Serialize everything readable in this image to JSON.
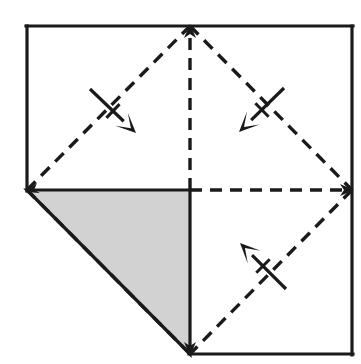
{
  "figure": {
    "canvas": {
      "width": 361,
      "height": 364,
      "background": "#ffffff"
    },
    "colors": {
      "stroke": "#1a1a1a",
      "shaded_fill": "#d2d2d2",
      "shaded_fill_label": "light gray",
      "background": "#ffffff"
    },
    "square": {
      "name": "outer square",
      "left": 27,
      "top": 26,
      "right": 352,
      "bottom": 354,
      "stroke_width": 3.2,
      "solid_edges": [
        {
          "name": "top-edge",
          "x1": 27,
          "y1": 26,
          "x2": 352,
          "y2": 26
        },
        {
          "name": "right-edge",
          "x1": 352,
          "y1": 26,
          "x2": 352,
          "y2": 354
        },
        {
          "name": "bottom-edge-right-half",
          "x1": 190,
          "y1": 354,
          "x2": 352,
          "y2": 354
        },
        {
          "name": "left-edge-upper-half",
          "x1": 27,
          "y1": 26,
          "x2": 27,
          "y2": 190
        }
      ]
    },
    "midpoints": {
      "top": {
        "x": 190,
        "y": 26
      },
      "right": {
        "x": 352,
        "y": 190
      },
      "bottom": {
        "x": 190,
        "y": 354
      },
      "left": {
        "x": 27,
        "y": 190
      },
      "center": {
        "x": 190,
        "y": 190
      }
    },
    "shaded_triangle": {
      "name": "shaded flap triangle",
      "fill": "#d2d2d2",
      "stroke": "#1a1a1a",
      "stroke_width": 3.2,
      "vertices": [
        {
          "x": 27,
          "y": 190
        },
        {
          "x": 190,
          "y": 190
        },
        {
          "x": 190,
          "y": 354
        }
      ]
    },
    "dashed_lines": {
      "dash_pattern": "12 8",
      "stroke_width": 3.4,
      "segments": [
        {
          "name": "diamond-top-left",
          "x1": 27,
          "y1": 190,
          "x2": 190,
          "y2": 26
        },
        {
          "name": "diamond-top-right",
          "x1": 190,
          "y1": 26,
          "x2": 352,
          "y2": 190
        },
        {
          "name": "diamond-bottom-right",
          "x1": 352,
          "y1": 190,
          "x2": 190,
          "y2": 354
        },
        {
          "name": "diamond-bottom-left",
          "x1": 190,
          "y1": 354,
          "x2": 27,
          "y2": 190
        },
        {
          "name": "vertical-median",
          "x1": 190,
          "y1": 190,
          "x2": 190,
          "y2": 26
        },
        {
          "name": "horizontal-median",
          "x1": 190,
          "y1": 190,
          "x2": 352,
          "y2": 190
        }
      ]
    },
    "vertex_arrowheads": [
      {
        "name": "top-vertex-arrowhead",
        "x": 190,
        "y": 26,
        "direction": "up"
      },
      {
        "name": "right-vertex-arrowhead",
        "x": 352,
        "y": 190,
        "direction": "right"
      },
      {
        "name": "left-vertex-arrowhead",
        "x": 27,
        "y": 190,
        "direction": "down-left"
      },
      {
        "name": "bottom-vertex-arrowhead",
        "x": 190,
        "y": 354,
        "direction": "down"
      }
    ],
    "fold_arrows": [
      {
        "name": "fold-arrow-top-left",
        "label": "upper left fold",
        "tail": {
          "x": 90,
          "y": 89
        },
        "head": {
          "x": 136,
          "y": 133
        },
        "tick": {
          "x": 113,
          "y": 111,
          "length": 19
        }
      },
      {
        "name": "fold-arrow-top-right",
        "label": "upper right fold",
        "tail": {
          "x": 284,
          "y": 88
        },
        "head": {
          "x": 239,
          "y": 132
        },
        "tick": {
          "x": 262,
          "y": 110,
          "length": 19
        }
      },
      {
        "name": "fold-arrow-bottom-right",
        "label": "lower right fold",
        "tail": {
          "x": 286,
          "y": 289
        },
        "head": {
          "x": 240,
          "y": 243
        },
        "tick": {
          "x": 263,
          "y": 266,
          "length": 19
        }
      }
    ]
  }
}
